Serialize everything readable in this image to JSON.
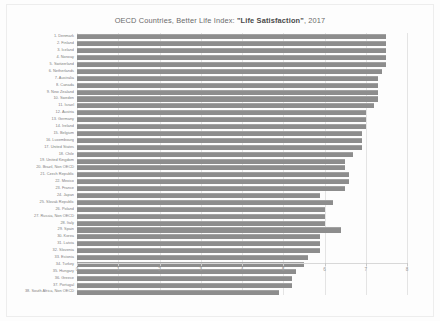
{
  "chart_data": {
    "type": "bar",
    "orientation": "horizontal",
    "title_prefix": "OECD Countries, Better Life Index: ",
    "title_emphasis": "\"Life Satisfaction\"",
    "title_suffix": ", 2017",
    "title": "OECD Countries, Better Life Index: \"Life Satisfaction\", 2017",
    "xlabel": "",
    "ylabel": "",
    "xlim": [
      0,
      8
    ],
    "xticks": [
      "0",
      "1",
      "2",
      "3",
      "4",
      "5",
      "6",
      "7",
      "8"
    ],
    "grid": true,
    "grid_axis": "x",
    "legend": false,
    "bar_color": "#8d8d8d",
    "background_color": "#fdfdfd",
    "categories": [
      "1. Denmark",
      "2. Finland",
      "3. Iceland",
      "4. Norway",
      "5. Switzerland",
      "6. Netherlands",
      "7. Australia",
      "8. Canada",
      "9. New Zealand",
      "10. Sweden",
      "11. Israel",
      "12. Austria",
      "13. Germany",
      "14. Ireland",
      "15. Belgium",
      "16. Luxembourg",
      "17. United States",
      "18. Chile",
      "19. United Kingdom",
      "20. Brazil, Non OECD",
      "21. Czech Republic",
      "22. Mexico",
      "23. France",
      "24. Japan",
      "25. Slovak Republic",
      "26. Poland",
      "27. Russia, Non OECD",
      "28. Italy",
      "29. Spain",
      "30. Korea",
      "31. Latvia",
      "32. Slovenia",
      "33. Estonia",
      "34. Turkey",
      "35. Hungary",
      "36. Greece",
      "37. Portugal",
      "38. South Africa, Non OECD"
    ],
    "values": [
      7.5,
      7.5,
      7.5,
      7.5,
      7.5,
      7.4,
      7.3,
      7.3,
      7.3,
      7.3,
      7.2,
      7.0,
      7.0,
      7.0,
      6.9,
      6.9,
      6.9,
      6.7,
      6.5,
      6.5,
      6.6,
      6.6,
      6.5,
      5.9,
      6.2,
      6.0,
      6.0,
      6.0,
      6.4,
      5.9,
      5.9,
      5.9,
      5.6,
      5.5,
      5.3,
      5.2,
      5.2,
      4.9
    ]
  }
}
